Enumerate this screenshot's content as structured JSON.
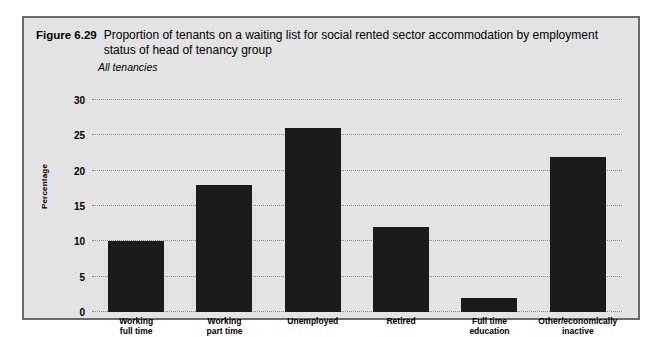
{
  "figure": {
    "number": "Figure 6.29",
    "title": "Proportion of tenants on a waiting list for social rented sector accommodation by employment status of head of tenancy group",
    "subtitle": "All tenancies"
  },
  "colors": {
    "panel_background": "#e3e3e3",
    "panel_border": "#6a6a6a",
    "bar": "#1b1b1b",
    "gridline": "#8e8e8e",
    "text": "#000000"
  },
  "chart_data": {
    "type": "bar",
    "title": "Proportion of tenants on a waiting list for social rented sector accommodation by employment status of head of tenancy group",
    "subtitle": "All tenancies",
    "xlabel": "",
    "ylabel": "Percentage",
    "ylim": [
      0,
      30
    ],
    "yticks": [
      0,
      5,
      10,
      15,
      20,
      25,
      30
    ],
    "ytick_labels": [
      "0",
      "5",
      "10",
      "15",
      "20",
      "25",
      "30"
    ],
    "grid": true,
    "legend": null,
    "categories": [
      "Working full time",
      "Working part time",
      "Unemployed",
      "Retired",
      "Full time education",
      "Other/economically inactive"
    ],
    "category_label_lines": [
      [
        "Working",
        "full time"
      ],
      [
        "Working",
        "part time"
      ],
      [
        "Unemployed",
        ""
      ],
      [
        "Retired",
        ""
      ],
      [
        "Full time",
        "education"
      ],
      [
        "Other/economically",
        "inactive"
      ]
    ],
    "values": [
      10,
      18,
      26,
      12,
      2,
      22
    ]
  }
}
